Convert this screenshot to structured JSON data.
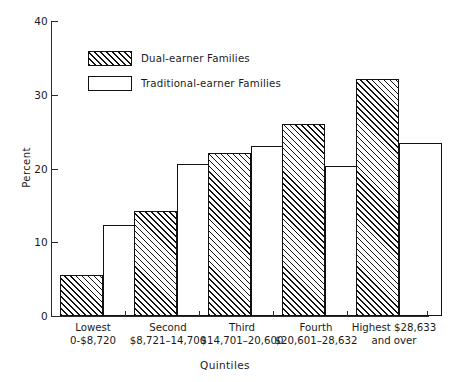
{
  "chart_data": {
    "type": "bar",
    "title": "",
    "xlabel": "Quintiles",
    "ylabel": "Percent",
    "ylim": [
      0,
      40
    ],
    "yticks": [
      0,
      10,
      20,
      30,
      40
    ],
    "ytick_labels": [
      "0",
      "10",
      "20",
      "30",
      "40"
    ],
    "grid": false,
    "legend_position": "upper-left-inside",
    "categories": [
      "Lowest 0-$8,720",
      "Second $8,721-14,700",
      "Third $14,701-20,600",
      "Fourth $20,601-28,632",
      "Highest $28,633 and over"
    ],
    "category_lines": [
      [
        "Lowest",
        "0-$8,720"
      ],
      [
        "Second",
        "$8,721–14,700"
      ],
      [
        "Third",
        "$14,701–20,600"
      ],
      [
        "Fourth",
        "$20,601–28,632"
      ],
      [
        "Highest $28,633",
        "and over"
      ]
    ],
    "series": [
      {
        "name": "Dual-earner Families",
        "style": "hatched",
        "values": [
          5.5,
          14.3,
          22.1,
          26.1,
          32.1
        ]
      },
      {
        "name": "Traditional-earner Families",
        "style": "open",
        "values": [
          12.4,
          20.6,
          23.0,
          20.3,
          23.4
        ]
      }
    ]
  },
  "legend": {
    "items": [
      {
        "label": "Dual-earner Families",
        "style": "hatched"
      },
      {
        "label": "Traditional-earner Families",
        "style": "open"
      }
    ]
  },
  "colors": {
    "axis": "#2b2b2b",
    "bar_outline": "#111111",
    "bar_fill": "#ffffff",
    "hatch": "#111111",
    "background": "#ffffff",
    "text": "#1a1a1a"
  }
}
